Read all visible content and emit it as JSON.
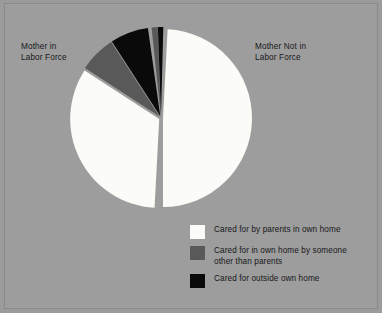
{
  "figure": {
    "background_color": "#9d9d9d",
    "border_color": "#8a8a8a"
  },
  "labels": {
    "left": "Mother in\nLabor Force",
    "right": "Mother Not in\nLabor Force"
  },
  "legend": {
    "items": [
      {
        "label": "Cared for by parents in own home",
        "color": "#fbfbf7",
        "swatch_name": "legend-swatch-parents-own-home"
      },
      {
        "label": "Cared for in own home by someone\nother than parents",
        "color": "#595959",
        "swatch_name": "legend-swatch-own-home-other"
      },
      {
        "label": "Cared for outside own home",
        "color": "#0a0a0a",
        "swatch_name": "legend-swatch-outside-own-home"
      }
    ]
  },
  "chart_data": {
    "type": "pie",
    "title": "",
    "legend_position": "bottom-right",
    "grid": false,
    "colors": {
      "parents_own_home": "#fbfbf7",
      "own_home_other_than_parents": "#595959",
      "outside_own_home": "#0a0a0a",
      "gap": "#9d9d9d"
    },
    "groups": [
      {
        "name": "Mother Not in Labor Force",
        "side": "right",
        "total_percent": 50.0
      },
      {
        "name": "Mother in Labor Force",
        "side": "left",
        "total_percent": 50.0
      }
    ],
    "categories": [
      "Cared for by parents in own home",
      "Cared for in own home by someone other than parents",
      "Cared for outside own home"
    ],
    "slices": [
      {
        "group": "Mother Not in Labor Force",
        "category": "Cared for by parents in own home",
        "color": "#fbfbf7",
        "value": 45.0,
        "start_angle": 3.0,
        "end_angle": 180.0
      },
      {
        "group": "Mother in Labor Force",
        "category": "Cared for by parents in own home",
        "color": "#fbfbf7",
        "value": 30.0,
        "start_angle": 183.0,
        "end_angle": 303.0
      },
      {
        "group": "Mother in Labor Force",
        "category": "Cared for in own home by someone other than parents",
        "color": "#595959",
        "value": 8.0,
        "start_angle": 303.0,
        "end_angle": 327.0
      },
      {
        "group": "Mother in Labor Force",
        "category": "Cared for outside own home",
        "color": "#0a0a0a",
        "value": 9.0,
        "start_angle": 327.0,
        "end_angle": 352.0
      },
      {
        "group": "Mother Not in Labor Force",
        "category": "Cared for in own home by someone other than parents",
        "color": "#595959",
        "value": 2.0,
        "start_angle": 354.0,
        "end_angle": 358.0
      },
      {
        "group": "Mother Not in Labor Force",
        "category": "Cared for outside own home",
        "color": "#0a0a0a",
        "value": 1.5,
        "start_angle": 358.0,
        "end_angle": 361.5
      }
    ],
    "geometry": {
      "center_x": 161,
      "center_y": 118,
      "radius": 89
    }
  }
}
